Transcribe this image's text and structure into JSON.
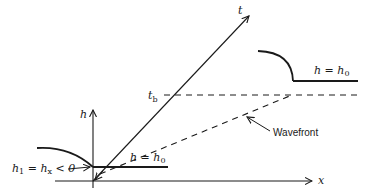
{
  "diagram": {
    "axes": {
      "h_label": "h",
      "x_label": "x",
      "t_label": "t"
    },
    "time_marker": {
      "symbol": "t",
      "subscript": "b"
    },
    "left_region": {
      "label_main": "h",
      "label_eq": " = h",
      "label_sub": "0"
    },
    "right_region": {
      "label_main": "h",
      "label_eq": " = h",
      "label_sub": "0"
    },
    "left_annotation": {
      "h": "h",
      "h_sub": "1",
      "eq1": " = h",
      "hx_sub": "x",
      "rest": " < 0"
    },
    "wavefront_label": "Wavefront",
    "colors": {
      "ink": "#1a1a1a",
      "background": "#ffffff"
    }
  }
}
